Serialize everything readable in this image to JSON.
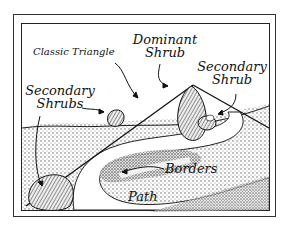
{
  "diagram": {
    "labels": {
      "classic_triangle": "Classic Triangle",
      "dominant_shrub_line1": "Dominant",
      "dominant_shrub_line2": "Shrub",
      "secondary_shrubs_line1": "Secondary",
      "secondary_shrubs_line2": "Shrubs",
      "secondary_shrub_line1": "Secondary",
      "secondary_shrub_line2": "Shrub",
      "borders": "Borders",
      "path": "Path"
    },
    "colors": {
      "ink": "#111111",
      "paper": "#ffffff",
      "stipple": "#8a8a8a"
    }
  }
}
